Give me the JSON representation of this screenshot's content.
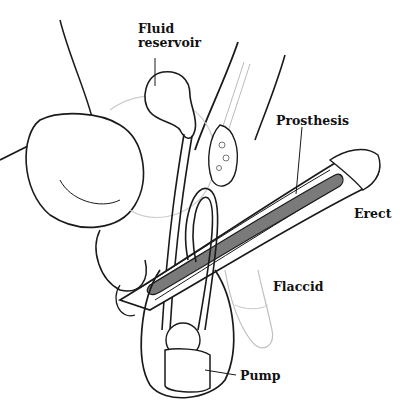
{
  "diagram": {
    "labels": {
      "fluid_reservoir_line1": "Fluid",
      "fluid_reservoir_line2": "reservoir",
      "prosthesis": "Prosthesis",
      "erect": "Erect",
      "flaccid": "Flaccid",
      "pump": "Pump"
    },
    "colors": {
      "outline": "#1a1a1a",
      "faint_outline": "#b8b8b8",
      "prosthesis_fill": "#7a7a7a",
      "background": "#ffffff"
    }
  }
}
